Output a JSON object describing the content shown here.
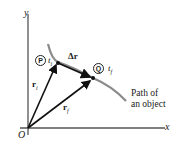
{
  "diagram": {
    "axes": {
      "x_label": "x",
      "y_label": "y",
      "origin_label": "O"
    },
    "points": [
      {
        "id": "P",
        "time_label": "t",
        "time_sub": "i"
      },
      {
        "id": "Q",
        "time_label": "t",
        "time_sub": "f"
      }
    ],
    "vectors": {
      "r_i": {
        "label": "r",
        "sub": "i"
      },
      "r_f": {
        "label": "r",
        "sub": "f"
      },
      "delta_r": {
        "label": "Δr"
      }
    },
    "path_label_line1": "Path of",
    "path_label_line2": "an object",
    "colors": {
      "path": "#8a8a8a",
      "vector": "#111111",
      "axis": "#555555"
    }
  }
}
